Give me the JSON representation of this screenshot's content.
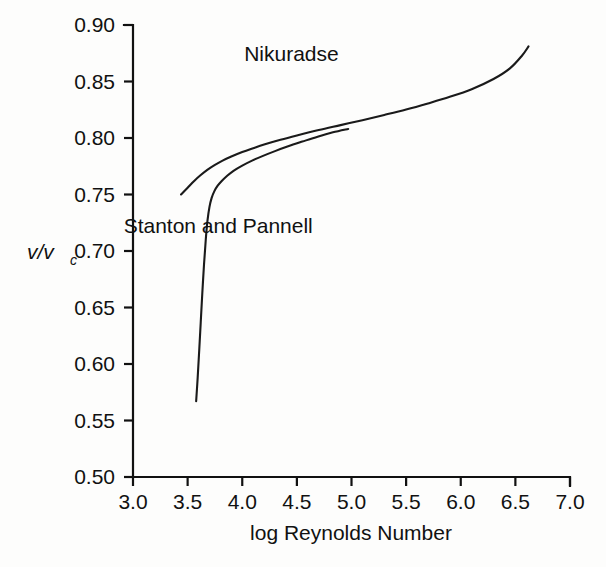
{
  "chart_data": {
    "type": "line",
    "title": "",
    "xlabel": "log Reynolds Number",
    "ylabel": "v/v_c",
    "ylabel_main": "v/v",
    "ylabel_subscript": "c",
    "xlim": [
      3.0,
      7.0
    ],
    "ylim": [
      0.5,
      0.9
    ],
    "grid": false,
    "legend_position": "inline-annotation",
    "xticks": [
      "3.0",
      "3.5",
      "4.0",
      "4.5",
      "5.0",
      "5.5",
      "6.0",
      "6.5",
      "7.0"
    ],
    "xtick_values": [
      3.0,
      3.5,
      4.0,
      4.5,
      5.0,
      5.5,
      6.0,
      6.5,
      7.0
    ],
    "yticks": [
      "0.50",
      "0.55",
      "0.60",
      "0.65",
      "0.70",
      "0.75",
      "0.80",
      "0.85",
      "0.90"
    ],
    "ytick_values": [
      0.5,
      0.55,
      0.6,
      0.65,
      0.7,
      0.75,
      0.8,
      0.85,
      0.9
    ],
    "series": [
      {
        "name": "Nikuradse",
        "label_x": 4.45,
        "label_y": 0.868,
        "points": [
          [
            3.44,
            0.75
          ],
          [
            3.5,
            0.756
          ],
          [
            3.56,
            0.762
          ],
          [
            3.62,
            0.7672
          ],
          [
            3.68,
            0.7718
          ],
          [
            3.75,
            0.7762
          ],
          [
            3.82,
            0.78
          ],
          [
            3.9,
            0.7836
          ],
          [
            4.0,
            0.7876
          ],
          [
            4.1,
            0.791
          ],
          [
            4.2,
            0.7942
          ],
          [
            4.35,
            0.7984
          ],
          [
            4.5,
            0.8022
          ],
          [
            4.7,
            0.807
          ],
          [
            4.9,
            0.8114
          ],
          [
            5.1,
            0.8158
          ],
          [
            5.3,
            0.8204
          ],
          [
            5.5,
            0.8252
          ],
          [
            5.7,
            0.8306
          ],
          [
            5.9,
            0.8364
          ],
          [
            6.1,
            0.8432
          ],
          [
            6.3,
            0.8522
          ],
          [
            6.45,
            0.8616
          ],
          [
            6.56,
            0.8728
          ],
          [
            6.62,
            0.881
          ]
        ]
      },
      {
        "name": "Stanton and Pannell",
        "label_x": 3.78,
        "label_y": 0.716,
        "points": [
          [
            3.578,
            0.567
          ],
          [
            3.592,
            0.588
          ],
          [
            3.606,
            0.612
          ],
          [
            3.62,
            0.637
          ],
          [
            3.634,
            0.662
          ],
          [
            3.65,
            0.688
          ],
          [
            3.666,
            0.71
          ],
          [
            3.682,
            0.727
          ],
          [
            3.7,
            0.739
          ],
          [
            3.72,
            0.747
          ],
          [
            3.745,
            0.753
          ],
          [
            3.775,
            0.7578
          ],
          [
            3.81,
            0.7618
          ],
          [
            3.86,
            0.7664
          ],
          [
            3.92,
            0.771
          ],
          [
            4.0,
            0.7756
          ],
          [
            4.09,
            0.78
          ],
          [
            4.19,
            0.7842
          ],
          [
            4.3,
            0.7884
          ],
          [
            4.42,
            0.7926
          ],
          [
            4.55,
            0.7968
          ],
          [
            4.69,
            0.8012
          ],
          [
            4.83,
            0.805
          ],
          [
            4.97,
            0.808
          ]
        ]
      }
    ]
  },
  "plot_geometry": {
    "left": 133,
    "right": 570,
    "top": 25,
    "bottom": 477
  },
  "colors": {
    "background": "#fdfdfc",
    "ink": "#111111",
    "curve": "#1a1a1a"
  }
}
